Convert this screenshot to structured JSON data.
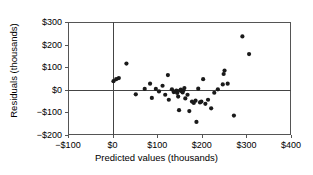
{
  "chart_data": {
    "type": "scatter",
    "title": "",
    "xlabel": "Predicted values (thousands)",
    "ylabel": "Residuals (thousands)",
    "xlim": [
      -100,
      400
    ],
    "ylim": [
      -200,
      300
    ],
    "xticks": [
      -100,
      0,
      100,
      200,
      300,
      400
    ],
    "yticks": [
      -200,
      -100,
      0,
      100,
      200,
      300
    ],
    "xtick_labels": [
      "−$100",
      "$0",
      "$100",
      "$200",
      "$300",
      "$400"
    ],
    "ytick_labels": [
      "−$200",
      "−$100",
      "$0",
      "$100",
      "$200",
      "$300"
    ],
    "grid": false,
    "legend": null,
    "reference_lines": [
      {
        "axis": "horizontal",
        "value": 0
      },
      {
        "axis": "vertical",
        "value": 0
      }
    ],
    "marker": {
      "shape": "circle",
      "color": "#1a1a1a",
      "size": 2.1
    },
    "points": [
      {
        "x": 2,
        "y": 38
      },
      {
        "x": 8,
        "y": 47
      },
      {
        "x": 14,
        "y": 52
      },
      {
        "x": 31,
        "y": 116
      },
      {
        "x": 52,
        "y": -20
      },
      {
        "x": 72,
        "y": 4
      },
      {
        "x": 84,
        "y": 27
      },
      {
        "x": 88,
        "y": -36
      },
      {
        "x": 97,
        "y": 4
      },
      {
        "x": 104,
        "y": -7
      },
      {
        "x": 112,
        "y": 18
      },
      {
        "x": 118,
        "y": -22
      },
      {
        "x": 124,
        "y": 65
      },
      {
        "x": 126,
        "y": -44
      },
      {
        "x": 133,
        "y": 2
      },
      {
        "x": 137,
        "y": -10
      },
      {
        "x": 140,
        "y": -8
      },
      {
        "x": 143,
        "y": -4
      },
      {
        "x": 145,
        "y": -14
      },
      {
        "x": 147,
        "y": -30
      },
      {
        "x": 149,
        "y": -90
      },
      {
        "x": 151,
        "y": -3
      },
      {
        "x": 153,
        "y": 1
      },
      {
        "x": 155,
        "y": -6
      },
      {
        "x": 157,
        "y": -12
      },
      {
        "x": 159,
        "y": -2
      },
      {
        "x": 161,
        "y": 8
      },
      {
        "x": 163,
        "y": -38
      },
      {
        "x": 168,
        "y": -22
      },
      {
        "x": 172,
        "y": -94
      },
      {
        "x": 178,
        "y": -52
      },
      {
        "x": 182,
        "y": -58
      },
      {
        "x": 186,
        "y": -48
      },
      {
        "x": 188,
        "y": -142
      },
      {
        "x": 192,
        "y": 5
      },
      {
        "x": 196,
        "y": -56
      },
      {
        "x": 199,
        "y": -52
      },
      {
        "x": 203,
        "y": 47
      },
      {
        "x": 208,
        "y": -62
      },
      {
        "x": 214,
        "y": -44
      },
      {
        "x": 221,
        "y": -82
      },
      {
        "x": 228,
        "y": -13
      },
      {
        "x": 236,
        "y": 2
      },
      {
        "x": 247,
        "y": 24
      },
      {
        "x": 249,
        "y": 70
      },
      {
        "x": 251,
        "y": 85
      },
      {
        "x": 258,
        "y": 27
      },
      {
        "x": 272,
        "y": -114
      },
      {
        "x": 291,
        "y": 236
      },
      {
        "x": 306,
        "y": 158
      }
    ]
  },
  "axes_geometry": {
    "left_px": 68,
    "right_px": 291,
    "top_px": 22,
    "bottom_px": 135
  }
}
